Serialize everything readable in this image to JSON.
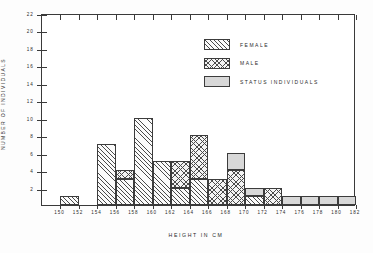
{
  "chart_data": {
    "type": "bar",
    "title": "",
    "subtitle": "",
    "xlabel": "HEIGHT IN CM",
    "ylabel": "NUMBER OF INDIVIDUALS",
    "xlim": [
      148,
      182
    ],
    "ylim": [
      0,
      22
    ],
    "grid": false,
    "stacked": true,
    "bin_width": 2,
    "legend_position": "upper-right",
    "x_tick_labels": [
      "150",
      "152",
      "154",
      "156",
      "158",
      "160",
      "162",
      "164",
      "166",
      "168",
      "170",
      "172",
      "174",
      "176",
      "178",
      "180",
      "182"
    ],
    "x_tick_values": [
      150,
      152,
      154,
      156,
      158,
      160,
      162,
      164,
      166,
      168,
      170,
      172,
      174,
      176,
      178,
      180,
      182
    ],
    "y_tick_labels": [
      "2",
      "4",
      "6",
      "8",
      "10",
      "12",
      "14",
      "16",
      "18",
      "20",
      "22"
    ],
    "y_tick_values": [
      2,
      4,
      6,
      8,
      10,
      12,
      14,
      16,
      18,
      20,
      22
    ],
    "categories": [
      "148-150",
      "150-152",
      "152-154",
      "154-156",
      "156-158",
      "158-160",
      "160-162",
      "162-164",
      "164-166",
      "166-168",
      "168-170",
      "170-172",
      "172-174",
      "174-176",
      "176-178",
      "178-180",
      "180-182"
    ],
    "bin_starts": [
      148,
      150,
      152,
      154,
      156,
      158,
      160,
      162,
      164,
      166,
      168,
      170,
      172,
      174,
      176,
      178,
      180
    ],
    "series": [
      {
        "name": "FEMALE",
        "fill": "diagonal-hatch",
        "color": "#fbfbfb",
        "values": [
          0,
          1,
          0,
          7,
          3,
          10,
          5,
          2,
          3,
          0,
          0,
          1,
          0,
          0,
          0,
          0,
          0
        ]
      },
      {
        "name": "MALE",
        "fill": "cross-hatch",
        "color": "#f4f4f4",
        "values": [
          0,
          0,
          0,
          0,
          1,
          0,
          0,
          3,
          5,
          3,
          4,
          0,
          2,
          0,
          0,
          0,
          0
        ]
      },
      {
        "name": "STATUS INDIVIDUALS",
        "fill": "solid-gray",
        "color": "#d8d8d8",
        "values": [
          0,
          0,
          0,
          0,
          0,
          0,
          0,
          0,
          0,
          0,
          2,
          1,
          0,
          1,
          1,
          1,
          1
        ]
      }
    ],
    "totals": [
      0,
      1,
      0,
      7,
      4,
      10,
      5,
      5,
      8,
      3,
      6,
      2,
      2,
      1,
      1,
      1,
      1
    ]
  },
  "legend": {
    "items": [
      {
        "label": "FEMALE"
      },
      {
        "label": "MALE"
      },
      {
        "label": "STATUS INDIVIDUALS"
      }
    ]
  },
  "axes": {
    "x_title": "HEIGHT IN CM",
    "y_title": "NUMBER OF INDIVIDUALS"
  }
}
